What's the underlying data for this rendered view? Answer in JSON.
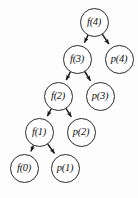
{
  "diagram": {
    "node_fill": "#ffffff",
    "node_stroke": "#2b2b2b",
    "edge_color": "#1a1a1a",
    "background": "#fdfdfd",
    "node_radius": 14.5,
    "nodes": [
      {
        "id": "f4",
        "label": "f(4)",
        "cx": 94,
        "cy": 22,
        "r": 14.5
      },
      {
        "id": "f3",
        "label": "f(3)",
        "cx": 77,
        "cy": 59,
        "r": 14.5
      },
      {
        "id": "p4",
        "label": "p(4)",
        "cx": 119,
        "cy": 59,
        "r": 14.5
      },
      {
        "id": "f2",
        "label": "f(2)",
        "cx": 58,
        "cy": 96,
        "r": 14.5
      },
      {
        "id": "p3",
        "label": "p(3)",
        "cx": 100,
        "cy": 96,
        "r": 14.5
      },
      {
        "id": "f1",
        "label": "f(1)",
        "cx": 39,
        "cy": 132,
        "r": 14.5
      },
      {
        "id": "p2",
        "label": "p(2)",
        "cx": 81,
        "cy": 132,
        "r": 14.5
      },
      {
        "id": "f0",
        "label": "f(0)",
        "cx": 24,
        "cy": 168,
        "r": 14.5
      },
      {
        "id": "p1",
        "label": "p(1)",
        "cx": 65,
        "cy": 168,
        "r": 14.5
      }
    ],
    "edges": [
      {
        "from": "f4",
        "to": "f3"
      },
      {
        "from": "f4",
        "to": "p4"
      },
      {
        "from": "f3",
        "to": "f2"
      },
      {
        "from": "f3",
        "to": "p3"
      },
      {
        "from": "f2",
        "to": "f1"
      },
      {
        "from": "f2",
        "to": "p2"
      },
      {
        "from": "f1",
        "to": "f0"
      },
      {
        "from": "f1",
        "to": "p1"
      }
    ]
  }
}
